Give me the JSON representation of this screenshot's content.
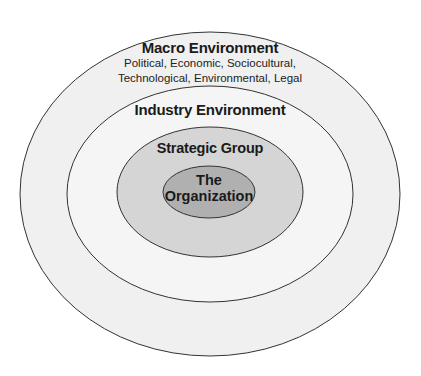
{
  "diagram": {
    "type": "nested-ellipses",
    "layers": [
      {
        "id": "macro",
        "title": "Macro Environment",
        "subtitle_lines": [
          "Political, Economic, Sociocultural,",
          "Technological, Environmental, Legal"
        ],
        "fill": "#f0f0f0"
      },
      {
        "id": "industry",
        "title": "Industry Environment",
        "fill": "#f5f5f5"
      },
      {
        "id": "strategic",
        "title": "Strategic Group",
        "fill": "#d5d5d5"
      },
      {
        "id": "organization",
        "title_lines": [
          "The",
          "Organization"
        ],
        "fill": "#b0b0b0"
      }
    ],
    "stroke": "#333333"
  }
}
